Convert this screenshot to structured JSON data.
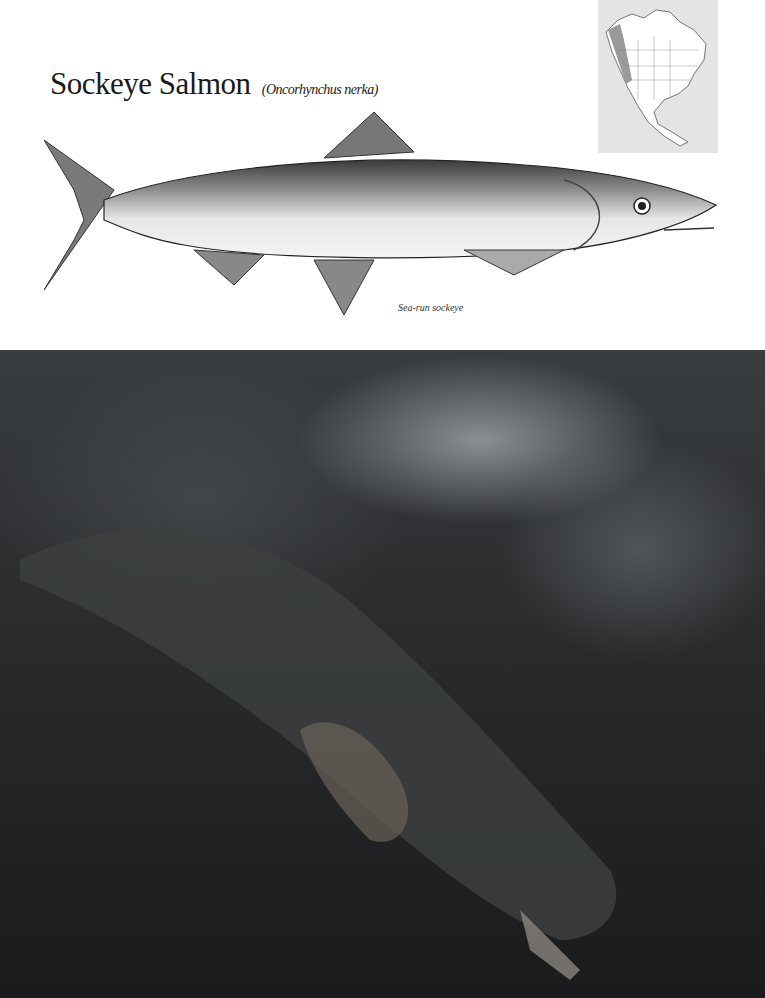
{
  "header": {
    "common_name": "Sockeye Salmon",
    "scientific_name": "(Oncorhynchus nerka)"
  },
  "illustration": {
    "caption": "Sea-run sockeye"
  },
  "range_map": {
    "region": "North America",
    "highlight_color": "#9a9a9a"
  },
  "photo": {
    "subject": "underwater sockeye salmon"
  }
}
